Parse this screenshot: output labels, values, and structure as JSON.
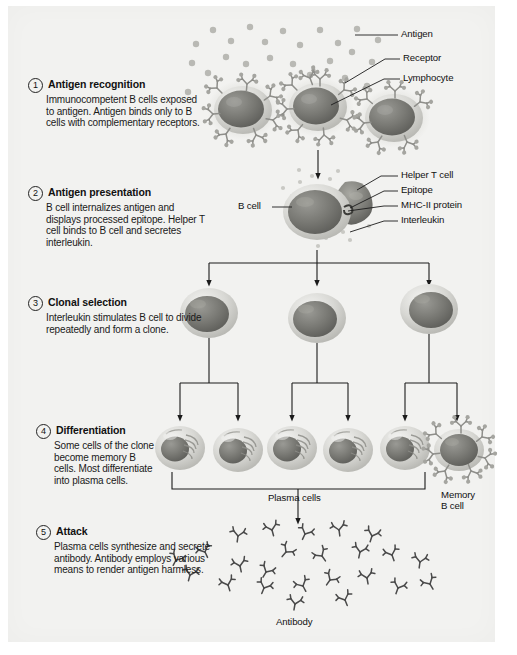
{
  "figure": {
    "background": "#f2f2f0",
    "ink": "#1b1b1b"
  },
  "steps": [
    {
      "number": "1",
      "title": "Antigen recognition",
      "body": "Immunocompetent B cells exposed to antigen. Antigen binds only to B cells with complementary receptors."
    },
    {
      "number": "2",
      "title": "Antigen presentation",
      "body": "B cell internalizes antigen and displays processed epitope. Helper T cell binds to B cell and secretes interleukin."
    },
    {
      "number": "3",
      "title": "Clonal selection",
      "body": "Interleukin stimulates B cell to divide repeatedly and form a clone."
    },
    {
      "number": "4",
      "title": "Differentiation",
      "body": "Some cells of the clone become memory B cells. Most differentiate into plasma cells."
    },
    {
      "number": "5",
      "title": "Attack",
      "body": "Plasma cells synthesize and secrete antibody. Antibody employs various means to render antigen harmless."
    }
  ],
  "callouts": {
    "antigen": "Antigen",
    "receptor": "Receptor",
    "lymphocyte": "Lymphocyte",
    "b_cell": "B cell",
    "helper_t_cell": "Helper T cell",
    "epitope": "Epitope",
    "mhc_ii_protein": "MHC-II protein",
    "interleukin": "Interleukin",
    "plasma_cells": "Plasma cells",
    "memory_b_cell_line1": "Memory",
    "memory_b_cell_line2": "B cell",
    "antibody": "Antibody"
  },
  "counts": {
    "lymphocytes_step1": 3,
    "clone_cells_step3": 3,
    "plasma_cells_step4": 5,
    "memory_b_cells_step4": 1,
    "antibodies_step5": 24
  }
}
